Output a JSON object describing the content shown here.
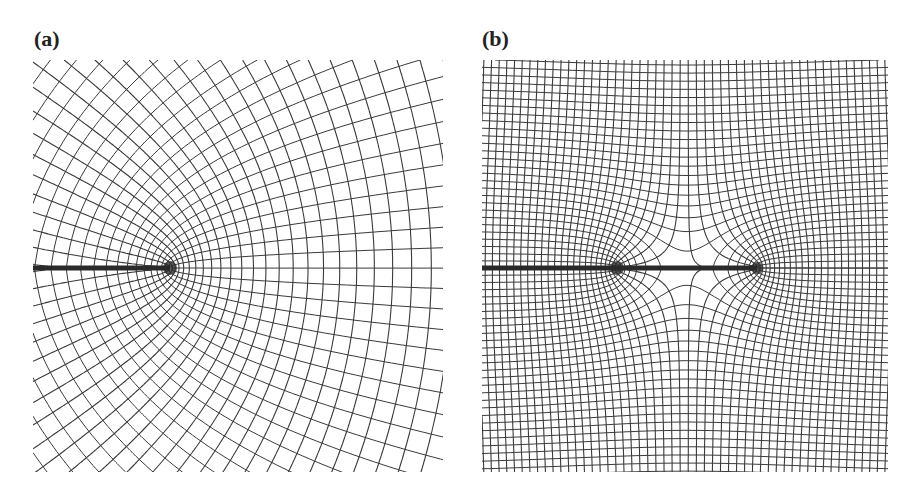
{
  "figure": {
    "panels": [
      {
        "id": "a",
        "label": "(a)",
        "description": "Orthogonal field-line net around a single crack tip; solid and dashed families of curves with a thick slit along the horizontal axis ending at one singular point",
        "singular_points": 1,
        "line_color": "#333333"
      },
      {
        "id": "b",
        "label": "(b)",
        "description": "Orthogonal field-line net around two singular points connected by a thick slit; closed lines form an elliptical lens between the points",
        "singular_points": 2,
        "line_color": "#333333"
      }
    ]
  }
}
